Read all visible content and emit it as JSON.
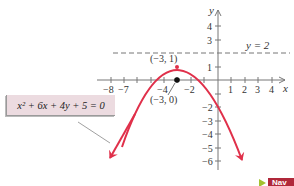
{
  "diagram": {
    "equation": "x² + 6x + 4y + 5 = 0",
    "axes": {
      "x_label": "x",
      "y_label": "y",
      "x_ticks_positive": [
        "1",
        "2",
        "3",
        "4"
      ],
      "x_ticks_negative": [
        "−8",
        "−7",
        "−4",
        "−2"
      ],
      "y_ticks_positive": [
        "1",
        "3",
        "4"
      ],
      "y_ticks_negative": [
        "−2",
        "−3",
        "−4",
        "−5",
        "−6"
      ]
    },
    "directrix_label": "y = 2",
    "vertex_label": "(−3, 1)",
    "focus_label": "(−3, 0)",
    "colors": {
      "curve": "#e0304a",
      "axes": "#777777",
      "equation_box": "#ecdbe0",
      "nav_button": "#b0283a",
      "nav_arrow": "#a3c22e"
    }
  },
  "nav": {
    "label": "Nav"
  }
}
